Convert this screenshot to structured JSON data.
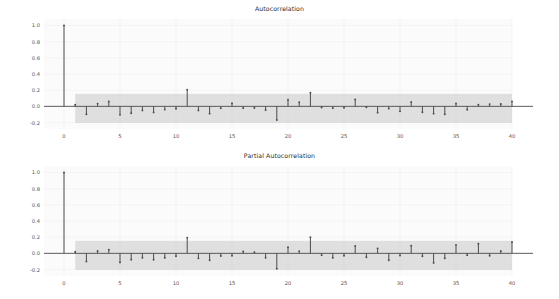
{
  "figure": {
    "background_color": "#ffffff",
    "panel_background_color": "#fbfbfb",
    "stem_color": "#4c4c4c",
    "band_color": "#c8c8c8",
    "axis_color": "#555555",
    "gridline_color": "#f2f2f2"
  },
  "panels": [
    {
      "id": "acf",
      "title": "Autocorrelation",
      "y_ticks": [
        "1.0",
        "0.8",
        "0.6",
        "0.4",
        "0.2",
        "0.0",
        "-0.2"
      ],
      "x_ticks": [
        "0",
        "5",
        "10",
        "15",
        "20",
        "25",
        "30",
        "35",
        "40"
      ]
    },
    {
      "id": "pacf",
      "title": "Partial Autocorrelation",
      "y_ticks": [
        "1.0",
        "0.8",
        "0.6",
        "0.4",
        "0.2",
        "0.0",
        "-0.2"
      ],
      "x_ticks": [
        "0",
        "5",
        "10",
        "15",
        "20",
        "25",
        "30",
        "35",
        "40"
      ]
    }
  ],
  "chart_data": [
    {
      "type": "bar",
      "id": "acf",
      "title": "Autocorrelation",
      "xlabel": "",
      "ylabel": "",
      "xlim": [
        -1,
        41
      ],
      "ylim": [
        -0.28,
        1.08
      ],
      "y_ticks": [
        1.0,
        0.8,
        0.6,
        0.4,
        0.2,
        0.0,
        -0.2
      ],
      "x_ticks": [
        0,
        5,
        10,
        15,
        20,
        25,
        30,
        35,
        40
      ],
      "grid": true,
      "legend": "none",
      "confidence_band": {
        "start_lag": 1,
        "end_lag": 40,
        "upper": 0.155,
        "lower": -0.205,
        "color": "#c8c8c8"
      },
      "categories": [
        0,
        1,
        2,
        3,
        4,
        5,
        6,
        7,
        8,
        9,
        10,
        11,
        12,
        13,
        14,
        15,
        16,
        17,
        18,
        19,
        20,
        21,
        22,
        23,
        24,
        25,
        26,
        27,
        28,
        29,
        30,
        31,
        32,
        33,
        34,
        35,
        36,
        37,
        38,
        39,
        40
      ],
      "values": [
        1.0,
        0.02,
        -0.098,
        0.034,
        0.06,
        -0.105,
        -0.085,
        -0.05,
        -0.075,
        -0.04,
        -0.03,
        0.205,
        -0.05,
        -0.09,
        -0.025,
        0.038,
        -0.022,
        -0.02,
        -0.045,
        -0.168,
        0.082,
        0.05,
        0.168,
        -0.015,
        -0.022,
        -0.018,
        0.085,
        -0.012,
        -0.078,
        -0.028,
        -0.062,
        0.055,
        -0.072,
        -0.09,
        -0.098,
        0.036,
        -0.042,
        0.02,
        0.028,
        0.03,
        0.062
      ]
    },
    {
      "type": "bar",
      "id": "pacf",
      "title": "Partial Autocorrelation",
      "xlabel": "",
      "ylabel": "",
      "xlim": [
        -1,
        41
      ],
      "ylim": [
        -0.28,
        1.08
      ],
      "y_ticks": [
        1.0,
        0.8,
        0.6,
        0.4,
        0.2,
        0.0,
        -0.2
      ],
      "x_ticks": [
        0,
        5,
        10,
        15,
        20,
        25,
        30,
        35,
        40
      ],
      "grid": true,
      "legend": "none",
      "confidence_band": {
        "start_lag": 1,
        "end_lag": 40,
        "upper": 0.155,
        "lower": -0.205,
        "color": "#c8c8c8"
      },
      "categories": [
        0,
        1,
        2,
        3,
        4,
        5,
        6,
        7,
        8,
        9,
        10,
        11,
        12,
        13,
        14,
        15,
        16,
        17,
        18,
        19,
        20,
        21,
        22,
        23,
        24,
        25,
        26,
        27,
        28,
        29,
        30,
        31,
        32,
        33,
        34,
        35,
        36,
        37,
        38,
        39,
        40
      ],
      "values": [
        1.0,
        0.02,
        -0.1,
        0.03,
        0.046,
        -0.112,
        -0.078,
        -0.055,
        -0.08,
        -0.055,
        -0.035,
        0.195,
        -0.062,
        -0.085,
        -0.032,
        -0.03,
        0.022,
        0.015,
        -0.055,
        -0.19,
        0.075,
        0.028,
        0.2,
        -0.022,
        -0.055,
        -0.03,
        0.09,
        -0.048,
        0.062,
        -0.085,
        -0.028,
        0.095,
        -0.035,
        -0.118,
        -0.06,
        0.105,
        -0.022,
        0.118,
        -0.03,
        0.03,
        0.14
      ]
    }
  ]
}
